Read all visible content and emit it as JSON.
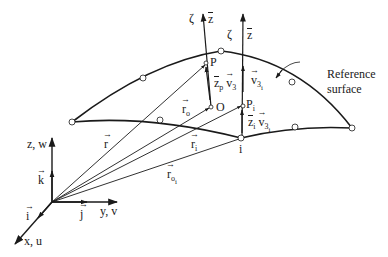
{
  "diagram": {
    "colors": {
      "stroke": "#1a1a1a",
      "node_fill": "#ffffff",
      "background": "#ffffff"
    },
    "global_axes": {
      "z_label": "z, w",
      "y_label": "y, v",
      "x_label": "x, u",
      "k_label": "k",
      "j_label": "j",
      "i_label": "i"
    },
    "vectors": {
      "r": "r",
      "r_o": "r",
      "r_o_sub": "o",
      "r_i": "r",
      "r_i_sub": "i",
      "r_oi": "r",
      "r_oi_sub": "o",
      "r_oi_subsub": "i"
    },
    "points": {
      "P": "P",
      "O": "O",
      "P_i": "P",
      "P_i_sub": "i",
      "node_i": "i"
    },
    "local_axes": {
      "zeta_left": "ζ",
      "zbar_left": "z",
      "zeta_right": "ζ",
      "zbar_right": "z"
    },
    "directors": {
      "zp": "z",
      "zp_sub": "p",
      "v3": "v",
      "v3_sub": "3",
      "v3i": "v",
      "v3i_sub": "3",
      "v3i_subsub": "i",
      "zi": "z",
      "zi_sub": "i",
      "v3i_b": "v",
      "v3i_b_sub": "3",
      "v3i_b_subsub": "i"
    },
    "annotation": {
      "line1": "Reference",
      "line2": "surface"
    }
  }
}
